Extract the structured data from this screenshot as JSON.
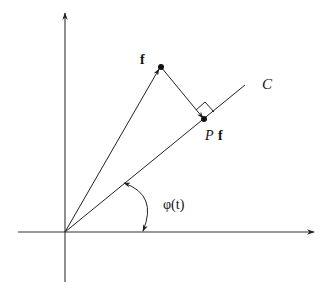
{
  "diagram": {
    "type": "vector-projection",
    "labels": {
      "vector": "f",
      "projection_P": "P",
      "projection_f": "f",
      "line": "C",
      "angle": "φ(t)"
    },
    "colors": {
      "stroke": "#222222",
      "axis": "#333333",
      "background": "#ffffff"
    },
    "points": {
      "origin": [
        65,
        232
      ],
      "f": [
        160,
        67
      ],
      "Pf": [
        204,
        120
      ],
      "line_end": [
        245,
        85
      ]
    }
  }
}
